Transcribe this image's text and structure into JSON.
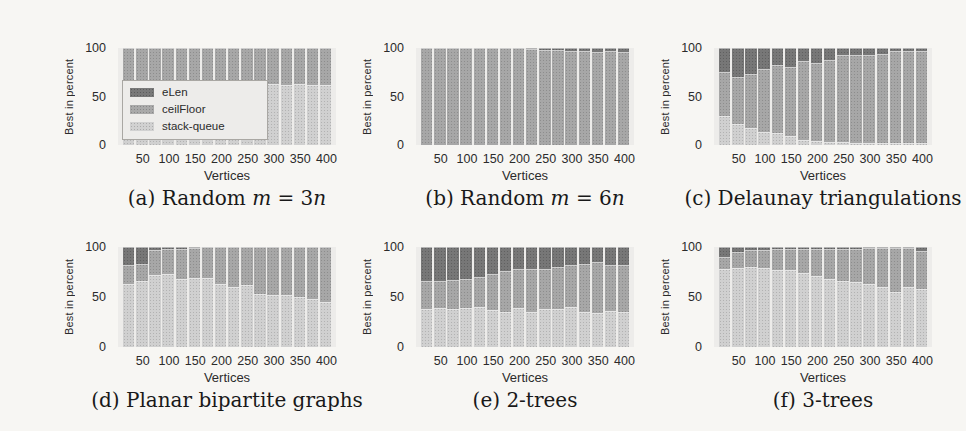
{
  "figure": {
    "description_note": "Six stacked bar charts comparing three algorithms, percentage of instances where each is best",
    "background": "#f7f6f3"
  },
  "colors": {
    "eLen": "#6e6e6e",
    "ceilFloor": "#a2a2a2",
    "stack_queue": "#cdcdcd",
    "plot_background": "#edecea",
    "text": "#2b2b2b"
  },
  "legend": {
    "entries": [
      {
        "label": "eLen",
        "color": "#6e6e6e"
      },
      {
        "label": "ceilFloor",
        "color": "#a2a2a2"
      },
      {
        "label": "stack-queue",
        "color": "#cdcdcd"
      }
    ]
  },
  "axes": {
    "ylabel": "Best in percent",
    "xlabel": "Vertices",
    "y_ticks": [
      "100",
      "50",
      "0"
    ],
    "x_ticks": [
      "50",
      "100",
      "150",
      "200",
      "250",
      "300",
      "350",
      "400"
    ]
  },
  "chart_data": [
    {
      "type": "bar",
      "stacked": true,
      "title": "(a) Random m = 3n",
      "xlabel": "Vertices",
      "ylabel": "Best in percent",
      "ylim": [
        0,
        100
      ],
      "legend_position": "inside-left",
      "grid": false,
      "categories": [
        25,
        50,
        75,
        100,
        125,
        150,
        175,
        200,
        225,
        250,
        275,
        300,
        325,
        350,
        375,
        400
      ],
      "series": [
        {
          "name": "stack-queue",
          "color": "#cdcdcd",
          "values": [
            65,
            64,
            64,
            63,
            64,
            63,
            63,
            62,
            65,
            63,
            62,
            63,
            62,
            63,
            62,
            62
          ]
        },
        {
          "name": "ceilFloor",
          "color": "#a2a2a2",
          "values": [
            35,
            36,
            36,
            37,
            36,
            37,
            37,
            38,
            35,
            37,
            38,
            37,
            38,
            37,
            38,
            38
          ]
        },
        {
          "name": "eLen",
          "color": "#6e6e6e",
          "values": [
            0,
            0,
            0,
            0,
            0,
            0,
            0,
            0,
            0,
            0,
            0,
            0,
            0,
            0,
            0,
            0
          ]
        }
      ],
      "caption_parts": [
        {
          "t": "(a) Random ",
          "i": 0
        },
        {
          "t": "m",
          "i": 1
        },
        {
          "t": " = 3",
          "i": 0
        },
        {
          "t": "n",
          "i": 1
        }
      ]
    },
    {
      "type": "bar",
      "stacked": true,
      "title": "(b) Random m = 6n",
      "xlabel": "Vertices",
      "ylabel": "Best in percent",
      "ylim": [
        0,
        100
      ],
      "grid": false,
      "categories": [
        25,
        50,
        75,
        100,
        125,
        150,
        175,
        200,
        225,
        250,
        275,
        300,
        325,
        350,
        375,
        400
      ],
      "series": [
        {
          "name": "stack-queue",
          "color": "#cdcdcd",
          "values": [
            0,
            0,
            0,
            0,
            0,
            0,
            0,
            0,
            0,
            0,
            0,
            0,
            0,
            0,
            0,
            0
          ]
        },
        {
          "name": "ceilFloor",
          "color": "#a2a2a2",
          "values": [
            100,
            100,
            100,
            100,
            100,
            100,
            100,
            100,
            99,
            98,
            98,
            97,
            97,
            96,
            97,
            96
          ]
        },
        {
          "name": "eLen",
          "color": "#6e6e6e",
          "values": [
            0,
            0,
            0,
            0,
            0,
            0,
            0,
            0,
            1,
            2,
            2,
            3,
            3,
            4,
            3,
            4
          ]
        }
      ],
      "caption_parts": [
        {
          "t": "(b) Random ",
          "i": 0
        },
        {
          "t": "m",
          "i": 1
        },
        {
          "t": " = 6",
          "i": 0
        },
        {
          "t": "n",
          "i": 1
        }
      ]
    },
    {
      "type": "bar",
      "stacked": true,
      "title": "(c) Delaunay triangulations",
      "xlabel": "Vertices",
      "ylabel": "Best in percent",
      "ylim": [
        0,
        100
      ],
      "grid": false,
      "categories": [
        25,
        50,
        75,
        100,
        125,
        150,
        175,
        200,
        225,
        250,
        275,
        300,
        325,
        350,
        375,
        400
      ],
      "series": [
        {
          "name": "stack-queue",
          "color": "#cdcdcd",
          "values": [
            30,
            22,
            18,
            13,
            12,
            9,
            5,
            4,
            3,
            3,
            2,
            2,
            2,
            2,
            2,
            2
          ]
        },
        {
          "name": "ceilFloor",
          "color": "#a2a2a2",
          "values": [
            45,
            48,
            55,
            65,
            70,
            71,
            82,
            81,
            85,
            90,
            91,
            91,
            92,
            95,
            95,
            95
          ]
        },
        {
          "name": "eLen",
          "color": "#6e6e6e",
          "values": [
            25,
            30,
            27,
            22,
            18,
            20,
            13,
            15,
            12,
            7,
            7,
            7,
            6,
            3,
            3,
            3
          ]
        }
      ],
      "caption_parts": [
        {
          "t": "(c) Delaunay triangulations",
          "i": 0
        }
      ]
    },
    {
      "type": "bar",
      "stacked": true,
      "title": "(d) Planar bipartite graphs",
      "xlabel": "Vertices",
      "ylabel": "Best in percent",
      "ylim": [
        0,
        100
      ],
      "grid": false,
      "categories": [
        25,
        50,
        75,
        100,
        125,
        150,
        175,
        200,
        225,
        250,
        275,
        300,
        325,
        350,
        375,
        400
      ],
      "series": [
        {
          "name": "stack-queue",
          "color": "#cdcdcd",
          "values": [
            63,
            66,
            72,
            73,
            68,
            69,
            69,
            63,
            60,
            62,
            53,
            52,
            52,
            50,
            48,
            45
          ]
        },
        {
          "name": "ceilFloor",
          "color": "#a2a2a2",
          "values": [
            19,
            17,
            25,
            25,
            30,
            30,
            31,
            37,
            40,
            38,
            47,
            48,
            48,
            50,
            52,
            55
          ]
        },
        {
          "name": "eLen",
          "color": "#6e6e6e",
          "values": [
            18,
            17,
            3,
            2,
            2,
            1,
            0,
            0,
            0,
            0,
            0,
            0,
            0,
            0,
            0,
            0
          ]
        }
      ],
      "caption_parts": [
        {
          "t": "(d) Planar bipartite graphs",
          "i": 0
        }
      ]
    },
    {
      "type": "bar",
      "stacked": true,
      "title": "(e) 2-trees",
      "xlabel": "Vertices",
      "ylabel": "Best in percent",
      "ylim": [
        0,
        100
      ],
      "grid": false,
      "categories": [
        25,
        50,
        75,
        100,
        125,
        150,
        175,
        200,
        225,
        250,
        275,
        300,
        325,
        350,
        375,
        400
      ],
      "series": [
        {
          "name": "stack-queue",
          "color": "#cdcdcd",
          "values": [
            38,
            39,
            38,
            39,
            40,
            37,
            35,
            39,
            35,
            38,
            38,
            40,
            35,
            34,
            36,
            35
          ]
        },
        {
          "name": "ceilFloor",
          "color": "#a2a2a2",
          "values": [
            28,
            27,
            29,
            29,
            30,
            36,
            41,
            39,
            43,
            40,
            42,
            42,
            48,
            51,
            46,
            47
          ]
        },
        {
          "name": "eLen",
          "color": "#6e6e6e",
          "values": [
            34,
            34,
            33,
            32,
            30,
            27,
            24,
            22,
            22,
            22,
            20,
            18,
            17,
            15,
            18,
            18
          ]
        }
      ],
      "caption_parts": [
        {
          "t": "(e) 2-trees",
          "i": 0
        }
      ]
    },
    {
      "type": "bar",
      "stacked": true,
      "title": "(f) 3-trees",
      "xlabel": "Vertices",
      "ylabel": "Best in percent",
      "ylim": [
        0,
        100
      ],
      "grid": false,
      "categories": [
        25,
        50,
        75,
        100,
        125,
        150,
        175,
        200,
        225,
        250,
        275,
        300,
        325,
        350,
        375,
        400
      ],
      "series": [
        {
          "name": "stack-queue",
          "color": "#cdcdcd",
          "values": [
            78,
            79,
            80,
            79,
            77,
            77,
            74,
            71,
            68,
            66,
            65,
            63,
            60,
            55,
            60,
            58
          ]
        },
        {
          "name": "ceilFloor",
          "color": "#a2a2a2",
          "values": [
            12,
            16,
            17,
            18,
            21,
            21,
            24,
            27,
            30,
            32,
            33,
            36,
            39,
            44,
            39,
            38
          ]
        },
        {
          "name": "eLen",
          "color": "#6e6e6e",
          "values": [
            10,
            5,
            3,
            3,
            2,
            2,
            2,
            2,
            2,
            2,
            2,
            1,
            1,
            1,
            1,
            4
          ]
        }
      ],
      "caption_parts": [
        {
          "t": "(f) 3-trees",
          "i": 0
        }
      ]
    }
  ]
}
